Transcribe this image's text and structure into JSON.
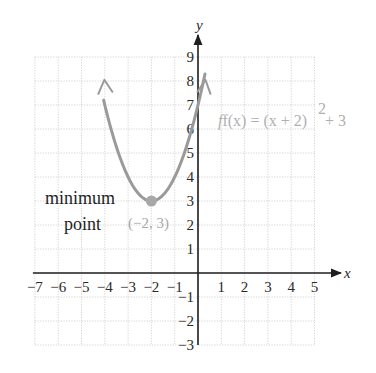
{
  "chart_data": {
    "type": "line",
    "title": "",
    "function": "f(x) = (x + 2)^2 + 3",
    "equation_label": "f(x) = (x + 2)² + 3",
    "xlabel": "x",
    "ylabel": "y",
    "xlim": [
      -7,
      5
    ],
    "ylim": [
      -3,
      9
    ],
    "grid": true,
    "x_ticks": [
      "−7",
      "−6",
      "−5",
      "−4",
      "−3",
      "−2",
      "−1",
      "1",
      "2",
      "3",
      "4",
      "5"
    ],
    "y_ticks": [
      "9",
      "8",
      "7",
      "6",
      "5",
      "4",
      "3",
      "2",
      "1",
      "−1",
      "−2",
      "−3"
    ],
    "series": [
      {
        "name": "f(x) = (x + 2)^2 + 3",
        "color": "#9a9a9a",
        "x": [
          -4,
          -3.5,
          -3,
          -2.5,
          -2,
          -1.5,
          -1,
          -0.5,
          0,
          0.3
        ],
        "y": [
          7,
          5.25,
          4,
          3.25,
          3,
          3.25,
          4,
          5.25,
          7,
          8.29
        ]
      }
    ],
    "annotations": [
      {
        "text": "minimum point",
        "x": -2,
        "y": 3
      },
      {
        "text": "(−2, 3)",
        "x": -2,
        "y": 3
      }
    ],
    "highlight_point": {
      "x": -2,
      "y": 3,
      "color": "#a8a8a8"
    }
  },
  "labels": {
    "x_axis": "x",
    "y_axis": "y",
    "equation": "f(x) = (x + 2)",
    "equation_exp": "2",
    "equation_tail": " + 3",
    "annotation_line1": "minimum",
    "annotation_line2": "point",
    "point_label": "(−2, 3)"
  },
  "ticks": {
    "x": [
      {
        "v": -7,
        "t": "−7"
      },
      {
        "v": -6,
        "t": "−6"
      },
      {
        "v": -5,
        "t": "−5"
      },
      {
        "v": -4,
        "t": "−4"
      },
      {
        "v": -3,
        "t": "−3"
      },
      {
        "v": -2,
        "t": "−2"
      },
      {
        "v": -1,
        "t": "−1"
      },
      {
        "v": 1,
        "t": "1"
      },
      {
        "v": 2,
        "t": "2"
      },
      {
        "v": 3,
        "t": "3"
      },
      {
        "v": 4,
        "t": "4"
      },
      {
        "v": 5,
        "t": "5"
      }
    ],
    "y": [
      {
        "v": 9,
        "t": "9"
      },
      {
        "v": 8,
        "t": "8"
      },
      {
        "v": 7,
        "t": "7"
      },
      {
        "v": 6,
        "t": "6"
      },
      {
        "v": 5,
        "t": "5"
      },
      {
        "v": 4,
        "t": "4"
      },
      {
        "v": 3,
        "t": "3"
      },
      {
        "v": 2,
        "t": "2"
      },
      {
        "v": 1,
        "t": "1"
      },
      {
        "v": -1,
        "t": "−1"
      },
      {
        "v": -2,
        "t": "−2"
      },
      {
        "v": -3,
        "t": "−3"
      }
    ]
  }
}
